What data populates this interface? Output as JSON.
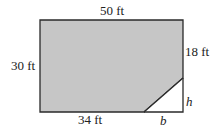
{
  "diagram": {
    "colors": {
      "fill": "#c6c6c6",
      "stroke": "#2a2a2a",
      "text": "#222222"
    },
    "labels": {
      "top": "50 ft",
      "left": "30 ft",
      "right_upper": "18 ft",
      "bottom": "34 ft",
      "triangle_base": "b",
      "triangle_height": "h"
    },
    "shape": {
      "polygon": [
        [
          40,
          20
        ],
        [
          183,
          20
        ],
        [
          183,
          78
        ],
        [
          144,
          112
        ],
        [
          40,
          112
        ]
      ],
      "triangle": [
        [
          144,
          112
        ],
        [
          183,
          112
        ],
        [
          183,
          78
        ]
      ]
    }
  }
}
